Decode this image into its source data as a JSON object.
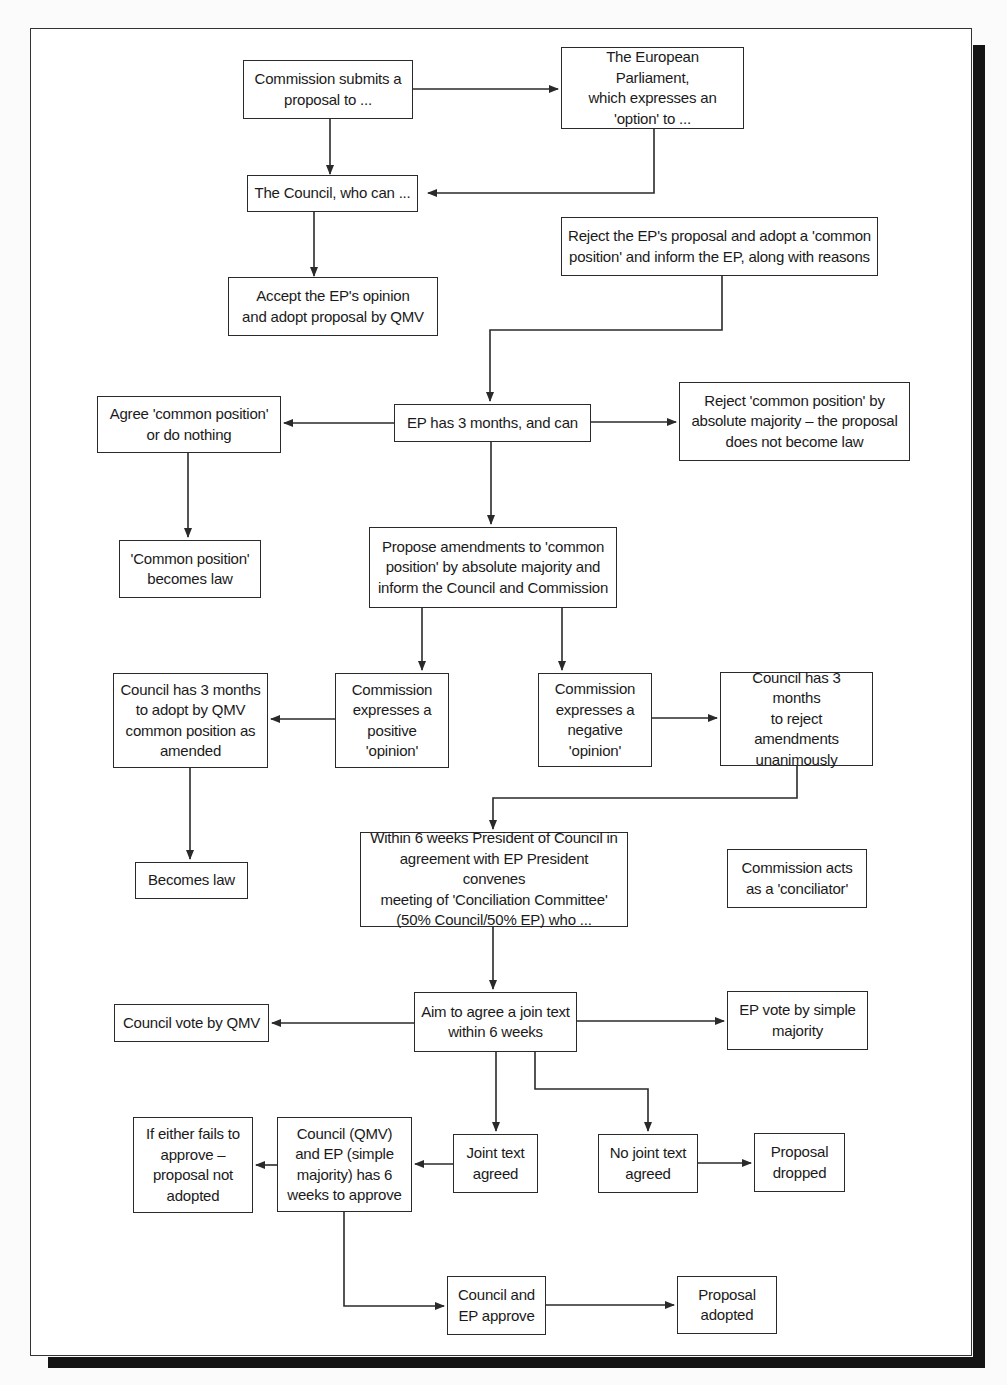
{
  "diagram": {
    "type": "flowchart",
    "nodes": {
      "commission_submits": "Commission submits a\nproposal to ...",
      "european_parliament": "The European Parliament,\nwhich expresses an\n'option' to ...",
      "council_who_can": "The Council, who can ...",
      "reject_ep_proposal": "Reject the EP's proposal and adopt a 'common\nposition' and inform the EP, along with reasons",
      "accept_ep_opinion": "Accept the EP's opinion\nand adopt proposal by QMV",
      "ep_three_months": "EP has 3 months, and can",
      "agree_common_position": "Agree 'common position'\nor do nothing",
      "reject_common_position": "Reject 'common position' by\nabsolute majority – the proposal\ndoes not become law",
      "common_position_law": "'Common position'\nbecomes law",
      "propose_amendments": "Propose amendments to 'common\nposition' by absolute majority and\ninform the Council and Commission",
      "council_adopt_qmv": "Council has 3 months\nto adopt by QMV\ncommon position as\namended",
      "commission_positive": "Commission\nexpresses a\npositive\n'opinion'",
      "commission_negative": "Commission\nexpresses a\nnegative\n'opinion'",
      "council_reject_unanimously": "Council has 3 months\nto reject\namendments\nunanimously",
      "becomes_law": "Becomes law",
      "conciliation_committee": "Within 6 weeks President of Council in\nagreement with EP President convenes\nmeeting of 'Conciliation Committee'\n(50% Council/50% EP) who ...",
      "commission_conciliator": "Commission acts\nas a 'conciliator'",
      "aim_joint_text": "Aim to agree a join text\nwithin 6 weeks",
      "council_vote_qmv": "Council vote by QMV",
      "ep_vote_simple": "EP vote by simple\nmajority",
      "either_fails": "If either fails to\napprove –\nproposal not\nadopted",
      "council_ep_six_weeks": "Council (QMV)\nand EP (simple\nmajority) has 6\nweeks to approve",
      "joint_text_agreed": "Joint text\nagreed",
      "no_joint_text": "No joint text\nagreed",
      "proposal_dropped": "Proposal\ndropped",
      "council_ep_approve": "Council and\nEP approve",
      "proposal_adopted": "Proposal\nadopted"
    },
    "edges": [
      [
        "commission_submits",
        "european_parliament"
      ],
      [
        "commission_submits",
        "council_who_can"
      ],
      [
        "european_parliament",
        "council_who_can"
      ],
      [
        "council_who_can",
        "accept_ep_opinion"
      ],
      [
        "reject_ep_proposal",
        "ep_three_months"
      ],
      [
        "ep_three_months",
        "agree_common_position"
      ],
      [
        "ep_three_months",
        "reject_common_position"
      ],
      [
        "ep_three_months",
        "propose_amendments"
      ],
      [
        "agree_common_position",
        "common_position_law"
      ],
      [
        "propose_amendments",
        "commission_positive"
      ],
      [
        "propose_amendments",
        "commission_negative"
      ],
      [
        "commission_positive",
        "council_adopt_qmv"
      ],
      [
        "commission_negative",
        "council_reject_unanimously"
      ],
      [
        "council_adopt_qmv",
        "becomes_law"
      ],
      [
        "council_reject_unanimously",
        "conciliation_committee"
      ],
      [
        "conciliation_committee",
        "aim_joint_text"
      ],
      [
        "aim_joint_text",
        "council_vote_qmv"
      ],
      [
        "aim_joint_text",
        "ep_vote_simple"
      ],
      [
        "aim_joint_text",
        "joint_text_agreed"
      ],
      [
        "aim_joint_text",
        "no_joint_text"
      ],
      [
        "joint_text_agreed",
        "council_ep_six_weeks"
      ],
      [
        "council_ep_six_weeks",
        "either_fails"
      ],
      [
        "council_ep_six_weeks",
        "council_ep_approve"
      ],
      [
        "no_joint_text",
        "proposal_dropped"
      ],
      [
        "council_ep_approve",
        "proposal_adopted"
      ]
    ]
  },
  "colors": {
    "line": "#2a2a2a",
    "box_fill": "#ffffff",
    "frame_shadow": "#141414"
  }
}
